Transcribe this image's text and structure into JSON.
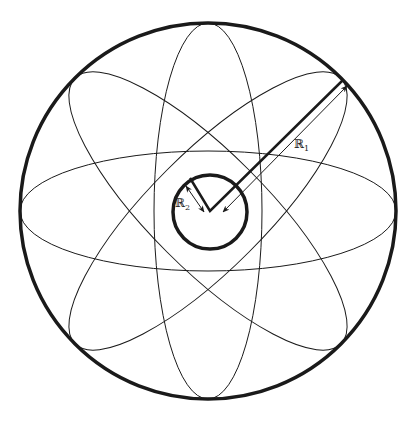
{
  "diagram": {
    "outer_circle": {
      "cx": 208,
      "cy": 211,
      "r": 188,
      "stroke_width": 3.5
    },
    "inner_circle": {
      "cx": 210,
      "cy": 212,
      "r": 37,
      "stroke_width": 3.5
    },
    "ellipses": {
      "cx": 208,
      "cy": 211,
      "rx": 188,
      "ry": 58,
      "angles_deg": [
        0,
        45,
        90,
        135
      ],
      "stroke_width": 1
    },
    "colors": {
      "stroke": "#1a1a1a",
      "background": "#ffffff"
    },
    "labels": {
      "r1": {
        "text": "ℝ",
        "sub": "1"
      },
      "r2": {
        "text": "ℝ",
        "sub": "2"
      }
    }
  }
}
